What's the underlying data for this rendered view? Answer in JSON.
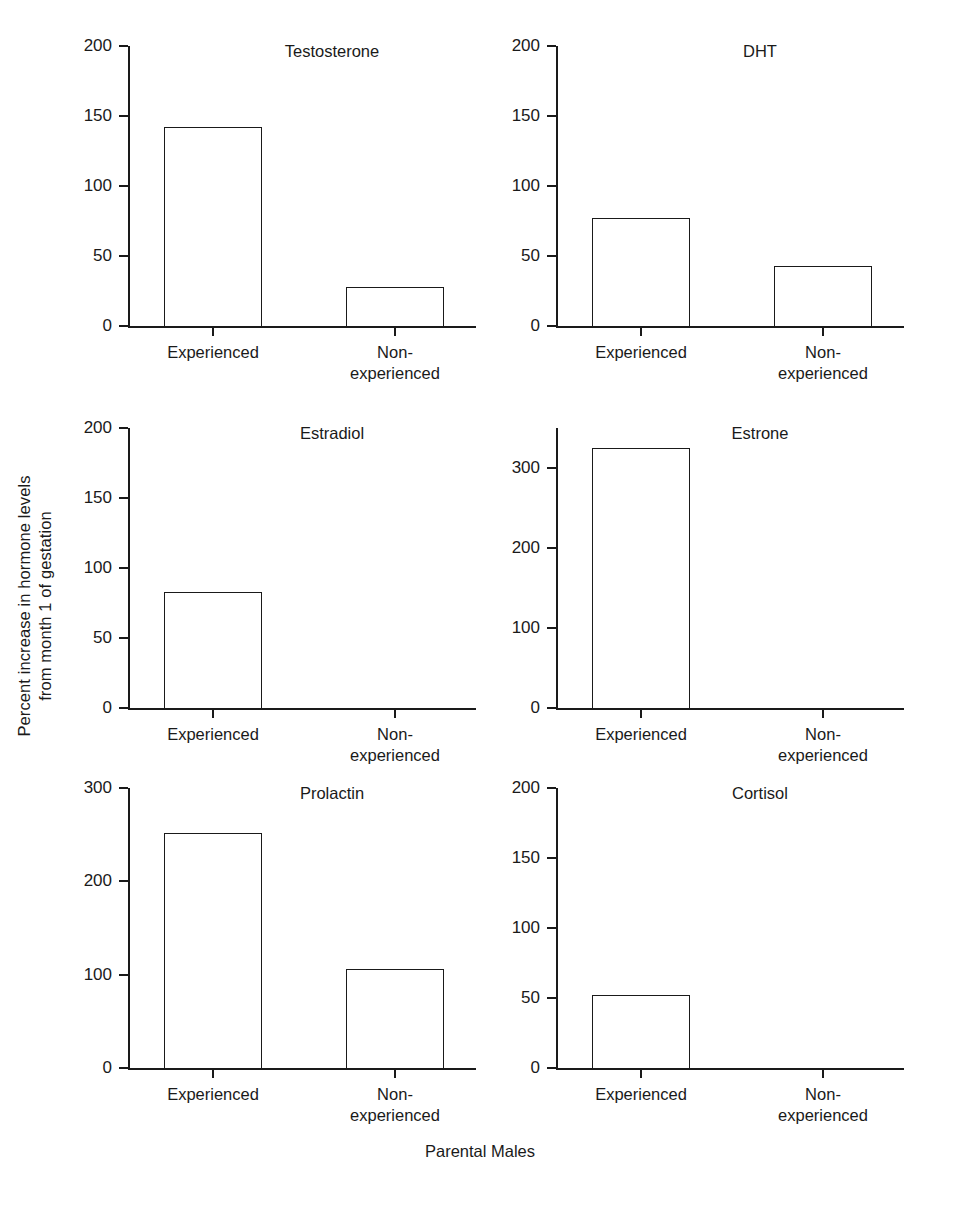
{
  "figure": {
    "ylabel_line1": "Percent increase in hormone levels",
    "ylabel_line2": "from month 1 of gestation",
    "xlabel": "Parental Males",
    "categories": [
      "Experienced",
      "Non-experienced"
    ],
    "category_label_lines": [
      [
        "Experienced"
      ],
      [
        "Non-",
        "experienced"
      ]
    ]
  },
  "chart_data": [
    {
      "type": "bar",
      "title": "Testosterone",
      "categories": [
        "Experienced",
        "Non-experienced"
      ],
      "values": [
        142,
        28
      ],
      "xlabel": "Parental Males",
      "ylabel": "Percent increase in hormone levels from month 1 of gestation",
      "ylim": [
        0,
        200
      ],
      "yticks": [
        0,
        50,
        100,
        150,
        200
      ],
      "ytick_labels": [
        "0",
        "50",
        "100",
        "150",
        "200"
      ],
      "grid": false,
      "legend": "none"
    },
    {
      "type": "bar",
      "title": "DHT",
      "categories": [
        "Experienced",
        "Non-experienced"
      ],
      "values": [
        77,
        43
      ],
      "xlabel": "Parental Males",
      "ylabel": "Percent increase in hormone levels from month 1 of gestation",
      "ylim": [
        0,
        200
      ],
      "yticks": [
        0,
        50,
        100,
        150,
        200
      ],
      "ytick_labels": [
        "0",
        "50",
        "100",
        "150",
        "200"
      ],
      "grid": false,
      "legend": "none"
    },
    {
      "type": "bar",
      "title": "Estradiol",
      "categories": [
        "Experienced",
        "Non-experienced"
      ],
      "values": [
        83,
        0
      ],
      "xlabel": "Parental Males",
      "ylabel": "Percent increase in hormone levels from month 1 of gestation",
      "ylim": [
        0,
        200
      ],
      "yticks": [
        0,
        50,
        100,
        150,
        200
      ],
      "ytick_labels": [
        "0",
        "50",
        "100",
        "150",
        "200"
      ],
      "grid": false,
      "legend": "none"
    },
    {
      "type": "bar",
      "title": "Estrone",
      "categories": [
        "Experienced",
        "Non-experienced"
      ],
      "values": [
        325,
        0
      ],
      "xlabel": "Parental Males",
      "ylabel": "Percent increase in hormone levels from month 1 of gestation",
      "ylim": [
        0,
        350
      ],
      "yticks": [
        0,
        100,
        200,
        300
      ],
      "ytick_labels": [
        "0",
        "100",
        "200",
        "300"
      ],
      "grid": false,
      "legend": "none"
    },
    {
      "type": "bar",
      "title": "Prolactin",
      "categories": [
        "Experienced",
        "Non-experienced"
      ],
      "values": [
        252,
        106
      ],
      "xlabel": "Parental Males",
      "ylabel": "Percent increase in hormone levels from month 1 of gestation",
      "ylim": [
        0,
        300
      ],
      "yticks": [
        0,
        100,
        200,
        300
      ],
      "ytick_labels": [
        "0",
        "100",
        "200",
        "300"
      ],
      "grid": false,
      "legend": "none"
    },
    {
      "type": "bar",
      "title": "Cortisol",
      "categories": [
        "Experienced",
        "Non-experienced"
      ],
      "values": [
        52,
        0
      ],
      "xlabel": "Parental Males",
      "ylabel": "Percent increase in hormone levels from month 1 of gestation",
      "ylim": [
        0,
        200
      ],
      "yticks": [
        0,
        50,
        100,
        150,
        200
      ],
      "ytick_labels": [
        "0",
        "50",
        "100",
        "150",
        "200"
      ],
      "grid": false,
      "legend": "none"
    }
  ],
  "panel_layout": [
    {
      "left": 128,
      "top": 46
    },
    {
      "left": 556,
      "top": 46
    },
    {
      "left": 128,
      "top": 428
    },
    {
      "left": 556,
      "top": 428
    },
    {
      "left": 128,
      "top": 788
    },
    {
      "left": 556,
      "top": 788
    }
  ]
}
